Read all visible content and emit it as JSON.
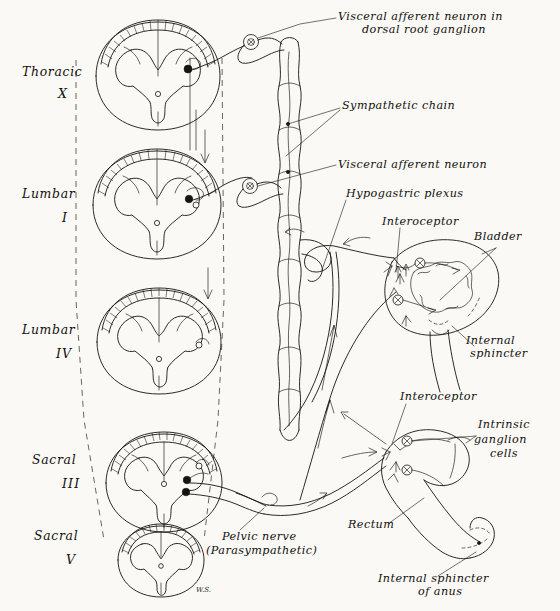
{
  "figure": {
    "background_color": "#faf9f6",
    "ink_color": "#17140f",
    "signature": "W.S."
  },
  "spinal_levels": [
    {
      "name": "Thoracic",
      "numeral": "X",
      "id": "thoracic-10"
    },
    {
      "name": "Lumbar",
      "numeral": "I",
      "id": "lumbar-1"
    },
    {
      "name": "Lumbar",
      "numeral": "IV",
      "id": "lumbar-4"
    },
    {
      "name": "Sacral",
      "numeral": "III",
      "id": "sacral-3"
    },
    {
      "name": "Sacral",
      "numeral": "V",
      "id": "sacral-5"
    }
  ],
  "labels": {
    "visceral_afferent_dorsal_root": {
      "line1": "Visceral afferent neuron in",
      "line2": "dorsal root ganglion"
    },
    "sympathetic_chain": "Sympathetic chain",
    "visceral_afferent_neuron": "Visceral afferent neuron",
    "hypogastric_plexus": "Hypogastric plexus",
    "interoceptor_bladder": "Interoceptor",
    "bladder": "Bladder",
    "internal_sphincter": {
      "line1": "Internal",
      "line2": "sphincter"
    },
    "interoceptor_rectum": "Interoceptor",
    "intrinsic_ganglion_cells": {
      "line1": "Intrinsic",
      "line2": "ganglion",
      "line3": "cells"
    },
    "rectum": "Rectum",
    "internal_sphincter_anus": {
      "line1": "Internal sphincter",
      "line2": "of anus"
    },
    "pelvic_nerve": {
      "line1": "Pelvic nerve",
      "line2": "(Parasympathetic)"
    }
  }
}
